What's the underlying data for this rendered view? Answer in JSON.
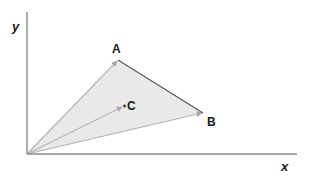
{
  "diagram": {
    "axes": {
      "x_label": "x",
      "y_label": "y",
      "origin": [
        27,
        154
      ],
      "x_end": [
        297,
        154
      ],
      "y_end": [
        27,
        12
      ],
      "color": "#8a8a8a"
    },
    "points": {
      "A": {
        "label": "A",
        "pos": [
          118,
          60
        ]
      },
      "B": {
        "label": "B",
        "pos": [
          203,
          113
        ]
      },
      "C": {
        "label": "C",
        "pos": [
          124,
          106
        ]
      }
    },
    "triangle_fill": "#e8e8e8",
    "vector_color": "#b0b0b0",
    "edge_AB_color": "#555555"
  }
}
